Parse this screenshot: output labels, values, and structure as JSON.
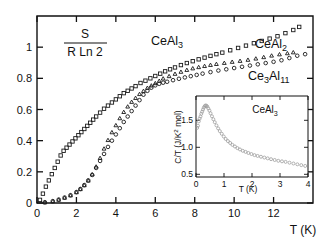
{
  "figure": {
    "background_color": "#ffffff",
    "foreground_color": "#111111",
    "inset_marker_color": "#9a9a9a"
  },
  "main_axis": {
    "ylabel_numerator": "S",
    "ylabel_denominator": "R Ln 2",
    "xlabel": "T (K)",
    "x_ticks": [
      "0",
      "2",
      "4",
      "6",
      "8",
      "10",
      "12"
    ],
    "y_ticks": [
      "0",
      "0.2",
      "0.4",
      "0.6",
      "0.8",
      "1"
    ]
  },
  "series_labels": {
    "ceal3": "CeAl3",
    "ceal3_base": "CeAl",
    "ceal3_sub": "3",
    "ceal2_base": "CeAl",
    "ceal2_sub": "2",
    "ce3al11_base_a": "Ce",
    "ce3al11_sub_a": "3",
    "ce3al11_base_b": "Al",
    "ce3al11_sub_b": "11"
  },
  "inset_axis": {
    "ylabel": "C/T  (J/K2 mol)",
    "ylabel_pre": "C/T  (J/K",
    "ylabel_sup": "2",
    "ylabel_post": " mol)",
    "xlabel": "T (K)",
    "x_ticks": [
      "0",
      "1",
      "2",
      "3",
      "4"
    ],
    "y_ticks": [
      "0.5",
      "1.0",
      "1.5"
    ],
    "series_label_base": "CeAl",
    "series_label_sub": "3"
  },
  "chart_data": [
    {
      "type": "scatter",
      "id": "main",
      "title": "",
      "xlabel": "T (K)",
      "ylabel": "S / (R Ln 2)",
      "xlim": [
        0,
        14
      ],
      "ylim": [
        0,
        1.2
      ],
      "xticks": [
        0,
        2,
        4,
        6,
        8,
        10,
        12
      ],
      "yticks": [
        0,
        0.2,
        0.4,
        0.6,
        0.8,
        1
      ],
      "grid": false,
      "legend": "inline-annotations",
      "series": [
        {
          "name": "CeAl3",
          "marker": "square",
          "x": [
            0.15,
            0.3,
            0.45,
            0.6,
            0.75,
            0.9,
            1.05,
            1.2,
            1.35,
            1.5,
            1.65,
            1.8,
            1.95,
            2.1,
            2.25,
            2.4,
            2.55,
            2.7,
            2.85,
            3.0,
            3.2,
            3.4,
            3.6,
            3.8,
            4.0,
            4.2,
            4.4,
            4.6,
            4.8,
            5.0,
            5.25,
            5.5,
            5.75,
            6.0,
            6.25,
            6.5,
            6.75,
            7.0,
            7.3,
            7.6,
            7.9,
            8.2,
            8.5,
            8.8,
            9.1,
            9.4,
            9.8,
            10.2,
            10.6,
            11.0,
            11.4,
            11.8,
            12.2,
            12.6,
            13.0,
            13.3
          ],
          "y": [
            0.02,
            0.06,
            0.105,
            0.145,
            0.185,
            0.225,
            0.265,
            0.305,
            0.335,
            0.355,
            0.375,
            0.395,
            0.415,
            0.435,
            0.455,
            0.475,
            0.495,
            0.515,
            0.535,
            0.555,
            0.58,
            0.605,
            0.625,
            0.645,
            0.665,
            0.685,
            0.705,
            0.72,
            0.735,
            0.75,
            0.77,
            0.785,
            0.8,
            0.815,
            0.83,
            0.845,
            0.858,
            0.87,
            0.885,
            0.898,
            0.91,
            0.922,
            0.933,
            0.944,
            0.955,
            0.965,
            0.98,
            0.995,
            1.01,
            1.025,
            1.04,
            1.055,
            1.07,
            1.09,
            1.11,
            1.13
          ]
        },
        {
          "name": "CeAl2",
          "marker": "triangle",
          "x": [
            0.4,
            0.8,
            1.1,
            1.4,
            1.7,
            2.0,
            2.2,
            2.4,
            2.6,
            2.8,
            3.0,
            3.2,
            3.4,
            3.6,
            3.8,
            4.0,
            4.2,
            4.4,
            4.6,
            4.8,
            5.0,
            5.2,
            5.4,
            5.6,
            5.8,
            6.0,
            6.2,
            6.4,
            6.7,
            7.0,
            7.3,
            7.6,
            7.9,
            8.2,
            8.5,
            8.8,
            9.1,
            9.5,
            9.9,
            10.3,
            10.7,
            11.1,
            11.5,
            11.9,
            12.3,
            12.7,
            13.0
          ],
          "y": [
            0.005,
            0.012,
            0.022,
            0.035,
            0.05,
            0.07,
            0.09,
            0.115,
            0.145,
            0.185,
            0.235,
            0.29,
            0.35,
            0.405,
            0.455,
            0.5,
            0.545,
            0.585,
            0.62,
            0.65,
            0.675,
            0.7,
            0.72,
            0.74,
            0.755,
            0.77,
            0.785,
            0.8,
            0.815,
            0.83,
            0.843,
            0.855,
            0.865,
            0.873,
            0.88,
            0.887,
            0.893,
            0.9,
            0.907,
            0.913,
            0.92,
            0.928,
            0.937,
            0.947,
            0.955,
            0.962,
            0.968
          ]
        },
        {
          "name": "Ce3Al11",
          "marker": "circle",
          "x": [
            0.4,
            0.8,
            1.1,
            1.4,
            1.7,
            2.0,
            2.2,
            2.4,
            2.6,
            2.8,
            3.0,
            3.2,
            3.4,
            3.6,
            3.8,
            4.0,
            4.2,
            4.4,
            4.6,
            4.8,
            5.0,
            5.2,
            5.4,
            5.6,
            5.8,
            6.0,
            6.2,
            6.4,
            6.6,
            6.9,
            7.2,
            7.5,
            7.8,
            8.1,
            8.4,
            8.8,
            9.2,
            9.6,
            10.0,
            10.4,
            10.8,
            11.2,
            11.6,
            12.0,
            12.4,
            12.8,
            13.2,
            13.6
          ],
          "y": [
            0.005,
            0.012,
            0.022,
            0.035,
            0.05,
            0.07,
            0.09,
            0.115,
            0.145,
            0.18,
            0.225,
            0.27,
            0.315,
            0.36,
            0.4,
            0.44,
            0.48,
            0.52,
            0.555,
            0.59,
            0.625,
            0.66,
            0.695,
            0.72,
            0.74,
            0.755,
            0.765,
            0.772,
            0.778,
            0.788,
            0.797,
            0.806,
            0.814,
            0.822,
            0.83,
            0.84,
            0.85,
            0.858,
            0.866,
            0.874,
            0.882,
            0.89,
            0.898,
            0.906,
            0.916,
            0.93,
            0.945,
            0.955
          ]
        }
      ]
    },
    {
      "type": "scatter",
      "id": "inset",
      "title": "CeAl3",
      "xlabel": "T (K)",
      "ylabel": "C/T (J/K2 mol)",
      "xlim": [
        0,
        4
      ],
      "ylim": [
        0.45,
        1.95
      ],
      "xticks": [
        0,
        1,
        2,
        3,
        4
      ],
      "yticks": [
        0.5,
        1.0,
        1.5
      ],
      "grid": false,
      "series": [
        {
          "name": "CeAl3 C/T",
          "marker": "circle",
          "x": [
            0.04,
            0.07,
            0.1,
            0.13,
            0.16,
            0.19,
            0.22,
            0.25,
            0.28,
            0.31,
            0.34,
            0.37,
            0.4,
            0.44,
            0.48,
            0.52,
            0.57,
            0.62,
            0.67,
            0.73,
            0.79,
            0.85,
            0.92,
            0.99,
            1.06,
            1.14,
            1.22,
            1.3,
            1.39,
            1.48,
            1.57,
            1.67,
            1.77,
            1.87,
            1.98,
            2.09,
            2.2,
            2.32,
            2.44,
            2.56,
            2.68,
            2.81,
            2.94,
            3.07,
            3.2,
            3.34,
            3.48,
            3.62,
            3.76,
            3.9
          ],
          "y": [
            1.36,
            1.4,
            1.48,
            1.53,
            1.57,
            1.62,
            1.66,
            1.7,
            1.735,
            1.76,
            1.775,
            1.77,
            1.755,
            1.72,
            1.68,
            1.63,
            1.575,
            1.52,
            1.465,
            1.405,
            1.35,
            1.3,
            1.25,
            1.2,
            1.155,
            1.115,
            1.08,
            1.045,
            1.015,
            0.985,
            0.96,
            0.935,
            0.915,
            0.895,
            0.875,
            0.855,
            0.84,
            0.825,
            0.81,
            0.795,
            0.78,
            0.765,
            0.75,
            0.74,
            0.73,
            0.715,
            0.7,
            0.685,
            0.67,
            0.655
          ]
        }
      ]
    }
  ]
}
